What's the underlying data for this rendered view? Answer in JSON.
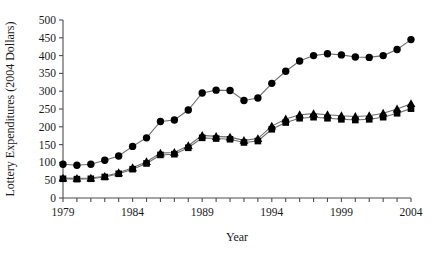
{
  "chart_data": {
    "type": "line",
    "title": "",
    "xlabel": "Year",
    "ylabel": "Lottery Expenditures (2004 Dollars)",
    "x": [
      1979,
      1980,
      1981,
      1982,
      1983,
      1984,
      1985,
      1986,
      1987,
      1988,
      1989,
      1990,
      1991,
      1992,
      1993,
      1994,
      1995,
      1996,
      1997,
      1998,
      1999,
      2000,
      2001,
      2002,
      2003,
      2004
    ],
    "xlim": [
      1979,
      2004
    ],
    "ylim": [
      0,
      500
    ],
    "xticks": [
      1979,
      1980,
      1981,
      1982,
      1983,
      1984,
      1985,
      1986,
      1987,
      1988,
      1989,
      1990,
      1991,
      1992,
      1993,
      1994,
      1995,
      1996,
      1997,
      1998,
      1999,
      2000,
      2001,
      2002,
      2003,
      2004
    ],
    "xtick_labels": [
      "1979",
      "",
      "",
      "",
      "",
      "1984",
      "",
      "",
      "",
      "",
      "1989",
      "",
      "",
      "",
      "",
      "1994",
      "",
      "",
      "",
      "",
      "1999",
      "",
      "",
      "",
      "",
      "2004"
    ],
    "yticks": [
      0,
      50,
      100,
      150,
      200,
      250,
      300,
      350,
      400,
      450,
      500
    ],
    "ytick_labels": [
      "0",
      "50",
      "100",
      "150",
      "200",
      "250",
      "300",
      "350",
      "400",
      "450",
      "500"
    ],
    "grid": false,
    "legend": "none",
    "series": [
      {
        "name": "series-circle",
        "marker": "circle",
        "color": "#000000",
        "values": [
          95,
          92,
          95,
          106,
          118,
          145,
          169,
          215,
          219,
          247,
          295,
          303,
          302,
          274,
          281,
          322,
          356,
          385,
          400,
          405,
          402,
          396,
          395,
          400,
          417,
          445
        ]
      },
      {
        "name": "series-triangle",
        "marker": "triangle",
        "color": "#000000",
        "values": [
          56,
          55,
          56,
          61,
          71,
          85,
          102,
          126,
          128,
          147,
          176,
          173,
          171,
          162,
          167,
          202,
          222,
          234,
          237,
          234,
          231,
          229,
          231,
          238,
          250,
          265
        ]
      },
      {
        "name": "series-square",
        "marker": "square",
        "color": "#000000",
        "values": [
          54,
          53,
          54,
          59,
          68,
          81,
          97,
          121,
          123,
          141,
          169,
          167,
          165,
          156,
          160,
          193,
          212,
          224,
          227,
          224,
          221,
          219,
          221,
          227,
          238,
          251
        ]
      }
    ]
  },
  "colors": {
    "axis": "#4d4d4d",
    "marker": "#000000",
    "line": "#6e6e6e",
    "text": "#1a1a1a",
    "background": "#ffffff"
  }
}
